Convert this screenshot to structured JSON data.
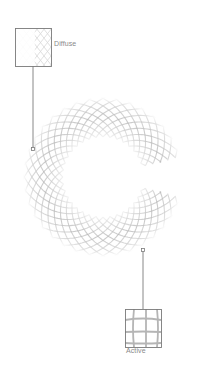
{
  "diagram": {
    "ring": {
      "center": [
        103,
        177
      ],
      "outer_radius": 80,
      "inner_radius": 40,
      "gap_start_deg": -14,
      "gap_end_deg": 14,
      "line_color": "#b8b8b8",
      "fade_color": "#ffffff"
    },
    "callouts": [
      {
        "id": "diffuse",
        "label": "Diffuse",
        "box": [
          15,
          28,
          36,
          38
        ],
        "anchor": [
          33,
          149
        ],
        "line_from": [
          33,
          66
        ],
        "label_pos": [
          54,
          46
        ]
      },
      {
        "id": "active",
        "label": "Active",
        "box": [
          125,
          309,
          36,
          38
        ],
        "anchor": [
          143,
          250
        ],
        "line_from": [
          143,
          309
        ],
        "label_pos": [
          126,
          353
        ]
      }
    ],
    "stroke_color": "#7a7a7a"
  }
}
